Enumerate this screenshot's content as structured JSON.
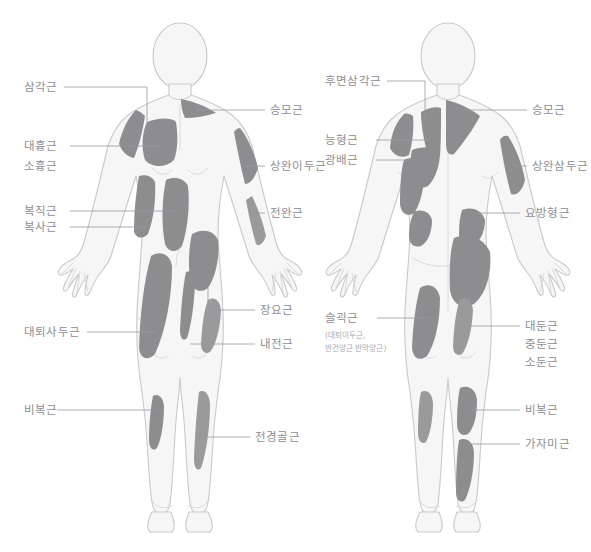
{
  "figure": {
    "views": [
      "anterior",
      "posterior"
    ],
    "colors": {
      "muscle_shade": "#8d8d90",
      "muscle_shade_light": "#9a9a9d",
      "body_fill": "#f6f6f6",
      "body_outline": "#c9c9cc",
      "label_text": "#8e8e93",
      "leader_line": "#9a9aa0",
      "background": "#ffffff"
    }
  },
  "front_view": {
    "name": "anterior-body-figure",
    "labels_left": [
      {
        "id": "deltoid",
        "text": "삼각근"
      },
      {
        "id": "pectoralis-major",
        "text": "대흉근"
      },
      {
        "id": "pectoralis-minor",
        "text": "소흉근"
      },
      {
        "id": "rectus-abdominis",
        "text": "복직근"
      },
      {
        "id": "obliques",
        "text": "복사근"
      },
      {
        "id": "quadriceps",
        "text": "대퇴사두근"
      },
      {
        "id": "gastrocnemius",
        "text": "비복근"
      }
    ],
    "labels_right": [
      {
        "id": "trapezius",
        "text": "승모근"
      },
      {
        "id": "biceps-brachii",
        "text": "상완이두근"
      },
      {
        "id": "forearm",
        "text": "전완근"
      },
      {
        "id": "iliopsoas",
        "text": "장요근"
      },
      {
        "id": "adductors",
        "text": "내전근"
      },
      {
        "id": "tibialis-anterior",
        "text": "전경골근"
      }
    ]
  },
  "back_view": {
    "name": "posterior-body-figure",
    "labels_left": [
      {
        "id": "posterior-deltoid",
        "text": "후면삼각근"
      },
      {
        "id": "rhomboids",
        "text": "능형근"
      },
      {
        "id": "latissimus-dorsi",
        "text": "광배근"
      },
      {
        "id": "hamstrings",
        "text": "슬괵근"
      },
      {
        "id": "hamstrings-sub1",
        "text": "(대퇴이두근,"
      },
      {
        "id": "hamstrings-sub2",
        "text": "반건양근 반막양근)"
      }
    ],
    "labels_right": [
      {
        "id": "trapezius-back",
        "text": "승모근"
      },
      {
        "id": "triceps-brachii",
        "text": "상완삼두근"
      },
      {
        "id": "quadratus-lumborum",
        "text": "요방형근"
      },
      {
        "id": "gluteus-maximus",
        "text": "대둔근"
      },
      {
        "id": "gluteus-medius",
        "text": "중둔근"
      },
      {
        "id": "gluteus-minimus",
        "text": "소둔근"
      },
      {
        "id": "gastrocnemius-back",
        "text": "비복근"
      },
      {
        "id": "soleus",
        "text": "가자미근"
      }
    ]
  }
}
